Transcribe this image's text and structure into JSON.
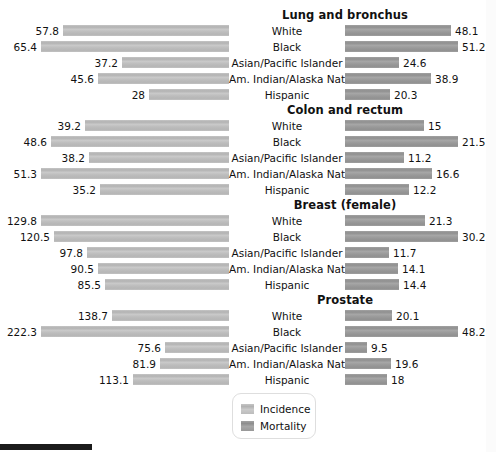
{
  "legend": {
    "items": [
      {
        "label": "Incidence",
        "swatch": "incidence-swatch",
        "color": "#bdbdbd"
      },
      {
        "label": "Mortality",
        "swatch": "mortality-swatch",
        "color": "#9a9a9a"
      }
    ]
  },
  "chart_data": {
    "type": "bar",
    "title": "",
    "orientation": "horizontal-diverging",
    "categories": [
      "White",
      "Black",
      "Asian/Pacific Islander",
      "Am. Indian/Alaska Native",
      "Hispanic"
    ],
    "series": [
      {
        "name": "Incidence",
        "side": "left",
        "color": "#bdbdbd"
      },
      {
        "name": "Mortality",
        "side": "right",
        "color": "#9a9a9a"
      }
    ],
    "panels": [
      {
        "title": "Lung and bronchus",
        "incidence": [
          57.8,
          65.4,
          37.2,
          45.6,
          28
        ],
        "mortality": [
          48.1,
          51.2,
          24.6,
          38.9,
          20.3
        ],
        "incidence_labels": [
          "57.8",
          "65.4",
          "37.2",
          "45.6",
          "28"
        ],
        "mortality_labels": [
          "48.1",
          "51.2",
          "24.6",
          "38.9",
          "20.3"
        ],
        "incidence_max": 65.4,
        "mortality_max": 51.2
      },
      {
        "title": "Colon and rectum",
        "incidence": [
          39.2,
          48.6,
          38.2,
          51.3,
          35.2
        ],
        "mortality": [
          15,
          21.5,
          11.2,
          16.6,
          12.2
        ],
        "incidence_labels": [
          "39.2",
          "48.6",
          "38.2",
          "51.3",
          "35.2"
        ],
        "mortality_labels": [
          "15",
          "21.5",
          "11.2",
          "16.6",
          "12.2"
        ],
        "incidence_max": 51.3,
        "mortality_max": 21.5
      },
      {
        "title": "Breast (female)",
        "incidence": [
          129.8,
          120.5,
          97.8,
          90.5,
          85.5
        ],
        "mortality": [
          21.3,
          30.2,
          11.7,
          14.1,
          14.4
        ],
        "incidence_labels": [
          "129.8",
          "120.5",
          "97.8",
          "90.5",
          "85.5"
        ],
        "mortality_labels": [
          "21.3",
          "30.2",
          "11.7",
          "14.1",
          "14.4"
        ],
        "incidence_max": 129.8,
        "mortality_max": 30.2
      },
      {
        "title": "Prostate",
        "incidence": [
          138.7,
          222.3,
          75.6,
          81.9,
          113.1
        ],
        "mortality": [
          20.1,
          48.2,
          9.5,
          19.6,
          18
        ],
        "incidence_labels": [
          "138.7",
          "222.3",
          "75.6",
          "81.9",
          "113.1"
        ],
        "mortality_labels": [
          "20.1",
          "48.2",
          "9.5",
          "19.6",
          "18"
        ],
        "incidence_max": 222.3,
        "mortality_max": 48.2
      }
    ],
    "xlabel": "",
    "ylabel": "",
    "grid": false,
    "legend_position": "bottom-center"
  }
}
